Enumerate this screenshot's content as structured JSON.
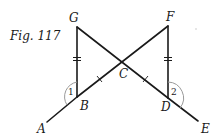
{
  "figure": {
    "caption": "Fig. 117",
    "points": {
      "G": {
        "label": "G",
        "x": 77,
        "y": 27
      },
      "F": {
        "label": "F",
        "x": 168,
        "y": 26
      },
      "C": {
        "label": "C",
        "x": 123,
        "y": 62
      },
      "B": {
        "label": "B",
        "x": 77,
        "y": 97
      },
      "D": {
        "label": "D",
        "x": 168,
        "y": 98
      },
      "A": {
        "label": "A",
        "x": 47,
        "y": 122
      },
      "E": {
        "label": "E",
        "x": 198,
        "y": 121
      }
    },
    "segments": [
      {
        "from": "G",
        "to": "B",
        "marks": "double-tick"
      },
      {
        "from": "F",
        "to": "D",
        "marks": "double-tick"
      },
      {
        "from": "G",
        "to": "D",
        "marks": "none"
      },
      {
        "from": "F",
        "to": "B",
        "marks": "none"
      },
      {
        "from": "A",
        "to": "B",
        "marks": "none"
      },
      {
        "from": "D",
        "to": "E",
        "marks": "none"
      },
      {
        "from": "B",
        "to": "C",
        "marks": "single-tick"
      },
      {
        "from": "C",
        "to": "D",
        "marks": "single-tick"
      }
    ],
    "angles": [
      {
        "label": "1",
        "vertex": "B",
        "between": [
          "G",
          "A"
        ]
      },
      {
        "label": "2",
        "vertex": "D",
        "between": [
          "F",
          "E"
        ]
      }
    ],
    "colors": {
      "line": "#1a1a1a",
      "arc": "#9a9a9a",
      "background": "#ffffff"
    }
  }
}
